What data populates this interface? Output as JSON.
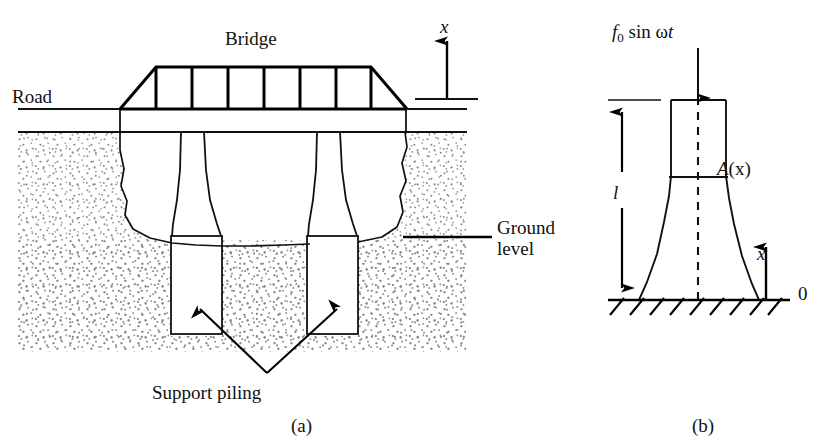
{
  "figure": {
    "panels": [
      {
        "id": "a",
        "caption": "(a)",
        "labels": {
          "bridge": "Bridge",
          "road": "Road",
          "ground_level": "Ground level",
          "support_piling": "Support piling",
          "axis_x": "x"
        },
        "structure": {
          "truss_cells": 6,
          "piles": 2,
          "soil_pattern": "stipple-dots"
        }
      },
      {
        "id": "b",
        "caption": "(b)",
        "labels": {
          "force": "f0 sin ωt",
          "force_symbol": "f",
          "force_subscript": "0",
          "force_rest": " sin ",
          "force_omega": "ω",
          "force_time": "t",
          "length": "l",
          "area": "A(x)",
          "area_symbol": "A",
          "area_arg": "(x)",
          "axis_x": "x",
          "origin": "0"
        },
        "structure": {
          "fixed_base": "hatched-ground",
          "hatch_ticks": 9,
          "centerline": "dashed"
        }
      }
    ],
    "colors": {
      "ink": "#000000",
      "background": "#ffffff",
      "stipple": "#8a8a8a",
      "thin_line": "#1a1a1a"
    }
  }
}
